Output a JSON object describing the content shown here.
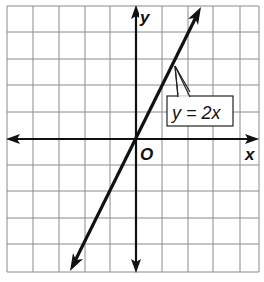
{
  "chart_data": {
    "type": "line",
    "title": "",
    "xlabel": "x",
    "ylabel": "y",
    "origin_label": "O",
    "grid": true,
    "xlim": [
      -5,
      5
    ],
    "ylim": [
      -5,
      5
    ],
    "series": [
      {
        "name": "y = 2x",
        "equation": "y = 2x",
        "slope": 2,
        "intercept": 0,
        "x": [
          -2.5,
          0,
          2.5
        ],
        "values": [
          -5,
          0,
          5
        ],
        "arrows": "both"
      }
    ],
    "annotations": [
      {
        "text": "y = 2x",
        "points_to": [
          1.5,
          3
        ]
      }
    ]
  },
  "colors": {
    "grid": "#8a8a8a",
    "axes": "#111111",
    "line": "#111111",
    "background": "#ffffff"
  }
}
